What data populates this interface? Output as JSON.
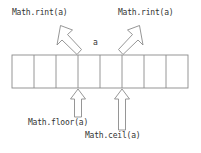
{
  "diagram": {
    "kind": "annotated-number-line",
    "colors": {
      "stroke": "#808080",
      "text": "#333333",
      "background": "#ffffff"
    },
    "grid": {
      "cells": 8,
      "left": 12,
      "right": 188,
      "top": 55,
      "bottom": 88,
      "divider_x": [
        12,
        34,
        56,
        78,
        100,
        122,
        144,
        166,
        188
      ]
    },
    "value_marker": {
      "label": "a",
      "x": 95,
      "y": 42
    },
    "labels": {
      "rint_left": "Math.rint(a)",
      "rint_right": "Math.rint(a)",
      "floor": "Math.floor(a)",
      "ceil": "Math.ceil(a)",
      "value": "a"
    },
    "arrows": [
      {
        "name": "rint-left-arrow",
        "direction": "up-left",
        "from_x": 78,
        "from_y": 57,
        "to_x": 62,
        "to_y": 26,
        "style": "hollow-block",
        "label": "Math.rint(a)"
      },
      {
        "name": "rint-right-arrow",
        "direction": "up-right",
        "from_x": 122,
        "from_y": 57,
        "to_x": 138,
        "to_y": 26,
        "style": "hollow-block",
        "label": "Math.rint(a)"
      },
      {
        "name": "floor-arrow",
        "direction": "up",
        "from_x": 78,
        "from_y": 117,
        "to_x": 78,
        "to_y": 89,
        "style": "hollow-block",
        "label": "Math.floor(a)"
      },
      {
        "name": "ceil-arrow",
        "direction": "up",
        "from_x": 122,
        "from_y": 130,
        "to_x": 122,
        "to_y": 89,
        "style": "hollow-block",
        "label": "Math.ceil(a)"
      }
    ]
  }
}
